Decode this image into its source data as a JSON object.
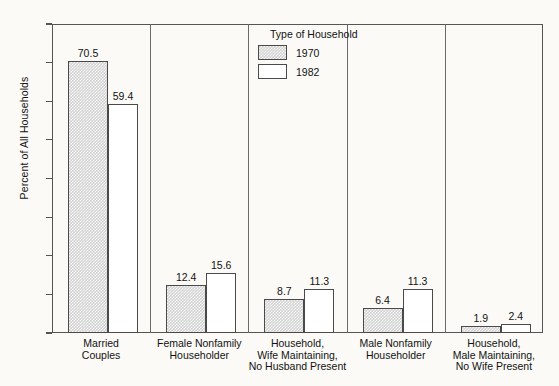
{
  "chart_data": {
    "type": "bar",
    "title": "",
    "xlabel": "",
    "ylabel": "Percent of All Households",
    "ylim": [
      0,
      80
    ],
    "yticks": [
      0,
      10,
      20,
      30,
      40,
      50,
      60,
      70,
      80
    ],
    "grid": false,
    "legend": {
      "title": "Type of Household",
      "position": "top-center-inside",
      "entries": [
        {
          "name": "1970",
          "swatch": "gray-checkered"
        },
        {
          "name": "1982",
          "swatch": "white"
        }
      ]
    },
    "categories": [
      "Married\nCouples",
      "Female Nonfamily\nHouseholder",
      "Household,\nWife Maintaining,\nNo Husband Present",
      "Male Nonfamily\nHouseholder",
      "Household,\nMale Maintaining,\nNo Wife Present"
    ],
    "series": [
      {
        "name": "1970",
        "values": [
          70.5,
          12.4,
          8.7,
          6.4,
          1.9
        ]
      },
      {
        "name": "1982",
        "values": [
          59.4,
          15.6,
          11.3,
          11.3,
          2.4
        ]
      }
    ],
    "data_labels": [
      [
        "70.5",
        "59.4"
      ],
      [
        "12.4",
        "15.6"
      ],
      [
        "8.7",
        "11.3"
      ],
      [
        "6.4",
        "11.3"
      ],
      [
        "1.9",
        "2.4"
      ]
    ]
  },
  "colors": {
    "series_1970": "#d2d2d2",
    "series_1982": "#ffffff",
    "outline": "#4a4a4a",
    "axis": "#555555",
    "text": "#121212",
    "background": "#fbfaf7"
  }
}
